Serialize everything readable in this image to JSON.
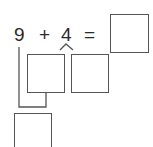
{
  "equation": {
    "operand1": "9",
    "operator": "+",
    "operand2": "4",
    "equals": "=",
    "answer": ""
  },
  "decomposition": {
    "part1": "",
    "part2": ""
  },
  "make_ten_result": "",
  "colors": {
    "line": "#555555",
    "text": "#2a2a2a",
    "background": "#ffffff"
  }
}
